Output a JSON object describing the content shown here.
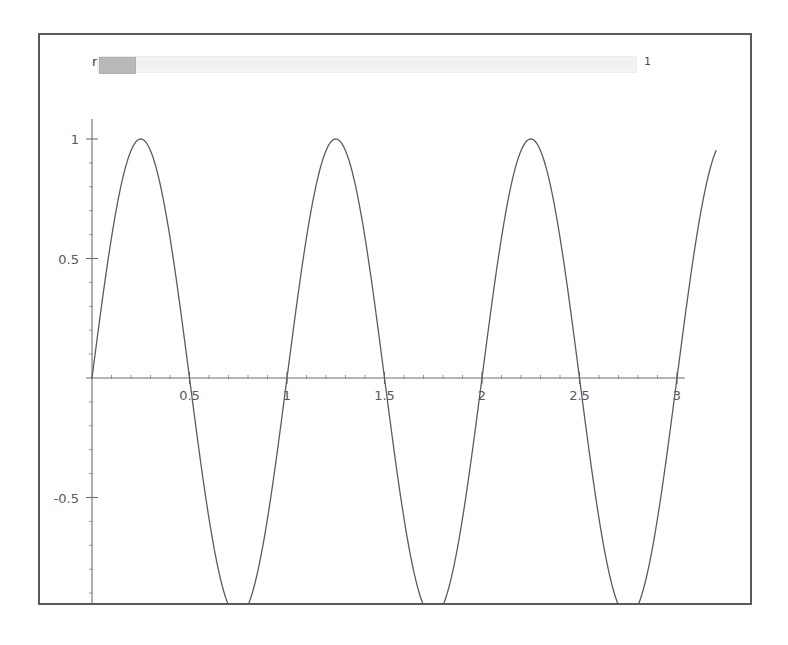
{
  "panel": {
    "border_color": "#59595e",
    "background": "#ffffff"
  },
  "control": {
    "label": "n",
    "value": "1",
    "slider_name": "n-slider",
    "thumb_fraction": 0.0,
    "track_color": "#f2f2f2",
    "thumb_color": "#b9b9b9"
  },
  "chart_data": {
    "type": "line",
    "title": "",
    "subtitle": "",
    "xlabel": "",
    "ylabel": "",
    "expression": "sin(2 pi n x)",
    "n": 1,
    "xlim": [
      0,
      3.2
    ],
    "ylim": [
      -1.05,
      1.05
    ],
    "grid": false,
    "legend": null,
    "legend_position": "none",
    "line_color": "#5a5a63",
    "axis_color": "#6e6e73",
    "x_ticks": [
      0.5,
      1,
      1.5,
      2,
      2.5,
      3
    ],
    "x_tick_labels": [
      "0.5",
      "1",
      "1.5",
      "2",
      "2.5",
      "3"
    ],
    "x_minor_step": 0.1,
    "y_ticks": [
      1,
      0.5,
      -0.5,
      -1
    ],
    "y_tick_labels": [
      "1",
      "0.5",
      "-0.5",
      "-1"
    ],
    "y_minor_step": 0.1,
    "series": [
      {
        "name": "sin(2 pi x)",
        "points_note": "amplitude 1, period 1, zeros at 0,0.5,1,1.5,2,2.5,3; peaks +1 at 0.25,1.25,2.25; troughs -1 at 0.75,1.75,2.75; curve ends near x=3.2 at y=0.81",
        "amplitude": 1,
        "period": 1,
        "phase": 0,
        "zeros": [
          0,
          0.5,
          1,
          1.5,
          2,
          2.5,
          3
        ],
        "maxima_x": [
          0.25,
          1.25,
          2.25
        ],
        "maxima_y": [
          1,
          1,
          1
        ],
        "minima_x": [
          0.75,
          1.75,
          2.75
        ],
        "minima_y": [
          -1,
          -1,
          -1
        ],
        "x": [
          0,
          0.05,
          0.1,
          0.15,
          0.2,
          0.25,
          0.3,
          0.35,
          0.4,
          0.45,
          0.5,
          0.55,
          0.6,
          0.65,
          0.7,
          0.75,
          0.8,
          0.85,
          0.9,
          0.95,
          1,
          1.05,
          1.1,
          1.15,
          1.2,
          1.25,
          1.3,
          1.35,
          1.4,
          1.45,
          1.5,
          1.55,
          1.6,
          1.65,
          1.7,
          1.75,
          1.8,
          1.85,
          1.9,
          1.95,
          2,
          2.05,
          2.1,
          2.15,
          2.2,
          2.25,
          2.3,
          2.35,
          2.4,
          2.45,
          2.5,
          2.55,
          2.6,
          2.65,
          2.7,
          2.75,
          2.8,
          2.85,
          2.9,
          2.95,
          3,
          3.05,
          3.1,
          3.15,
          3.2
        ],
        "values": [
          0,
          0.309,
          0.588,
          0.809,
          0.951,
          1,
          0.951,
          0.809,
          0.588,
          0.309,
          0,
          -0.309,
          -0.588,
          -0.809,
          -0.951,
          -1,
          -0.951,
          -0.809,
          -0.588,
          -0.309,
          0,
          0.309,
          0.588,
          0.809,
          0.951,
          1,
          0.951,
          0.809,
          0.588,
          0.309,
          0,
          -0.309,
          -0.588,
          -0.809,
          -0.951,
          -1,
          -0.951,
          -0.809,
          -0.588,
          -0.309,
          0,
          0.309,
          0.588,
          0.809,
          0.951,
          1,
          0.951,
          0.809,
          0.588,
          0.309,
          0,
          -0.309,
          -0.588,
          -0.809,
          -0.951,
          -1,
          -0.951,
          -0.809,
          -0.588,
          -0.309,
          0,
          0.309,
          0.588,
          0.809,
          0.951
        ]
      }
    ]
  }
}
